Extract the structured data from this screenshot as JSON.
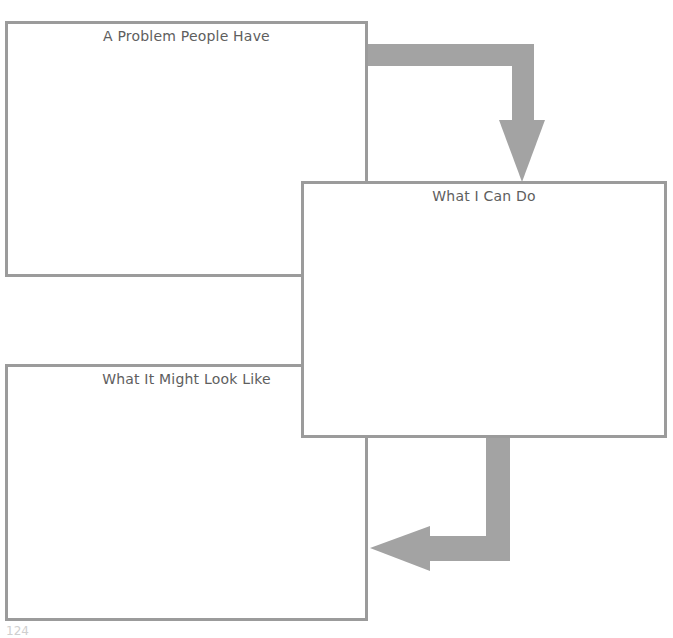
{
  "boxes": {
    "problem": {
      "title": "A Problem People Have"
    },
    "what_i_can_do": {
      "title": "What I Can Do"
    },
    "what_it_might_look_like": {
      "title": "What It Might Look Like"
    }
  },
  "arrows": [
    {
      "from": "problem",
      "to": "what_i_can_do",
      "direction": "right-then-down"
    },
    {
      "from": "what_i_can_do",
      "to": "what_it_might_look_like",
      "direction": "down-then-left"
    }
  ],
  "colors": {
    "border": "#9b9b9b",
    "arrow": "#a3a3a3",
    "text": "#5e5e5e"
  },
  "page": {
    "number": "124"
  }
}
